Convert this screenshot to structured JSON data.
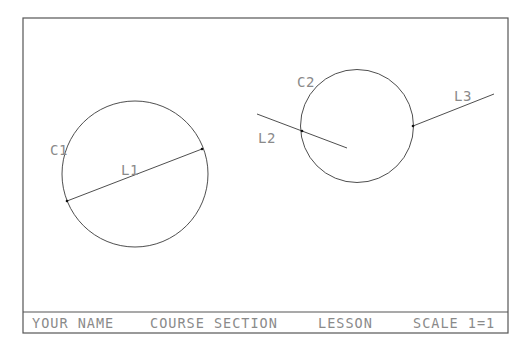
{
  "drawing": {
    "stroke_color": "#3a3a3a",
    "text_color": "#8a8a8a",
    "border_color": "#555555",
    "labels": {
      "c1": "C1",
      "c2": "C2",
      "l1": "L1",
      "l2": "L2",
      "l3": "L3"
    }
  },
  "title_block": {
    "name": "YOUR NAME",
    "course_section": "COURSE SECTION",
    "lesson": "LESSON",
    "scale": "SCALE 1=1"
  }
}
